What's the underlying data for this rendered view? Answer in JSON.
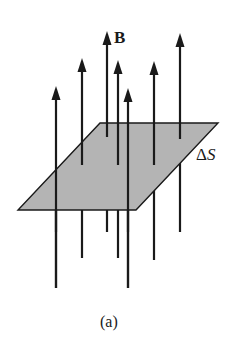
{
  "figure": {
    "field_label": "B",
    "surface_label_delta": "Δ",
    "surface_label_var": "S",
    "caption": "(a)"
  },
  "colors": {
    "plane_fill": "#b4b4b4",
    "line": "#1a1a1a",
    "background": "#ffffff"
  },
  "geometry": {
    "plane": [
      [
        100,
        123
      ],
      [
        218,
        123
      ],
      [
        136,
        210
      ],
      [
        18,
        210
      ]
    ],
    "field_lines": [
      {
        "x": 56,
        "top": 88,
        "bottom": 288
      },
      {
        "x": 82,
        "top": 60,
        "bottom": 258
      },
      {
        "x": 107,
        "top": 33,
        "bottom": 232
      },
      {
        "x": 118,
        "top": 62,
        "bottom": 258
      },
      {
        "x": 128,
        "top": 90,
        "bottom": 288
      },
      {
        "x": 154,
        "top": 63,
        "bottom": 260
      },
      {
        "x": 180,
        "top": 35,
        "bottom": 232
      }
    ]
  }
}
